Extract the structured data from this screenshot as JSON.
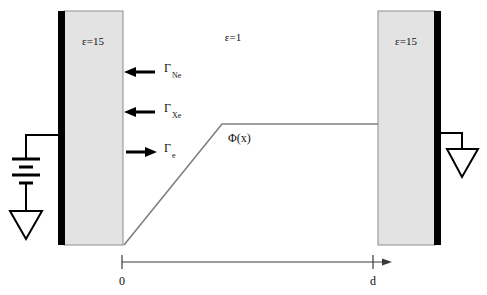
{
  "figure": {
    "kind": "parallel-plate-capacitor-cross-section",
    "background_color": "#ffffff"
  },
  "regions": {
    "left_slab": {
      "permittivity_label": "ε=15",
      "fill_color": "#e3e3e3",
      "border_color": "#8d8d8d",
      "electrode_color": "#000000",
      "electrode_side": "left"
    },
    "gap": {
      "permittivity_label": "ε=1"
    },
    "right_slab": {
      "permittivity_label": "ε=15",
      "fill_color": "#e3e3e3",
      "border_color": "#8d8d8d",
      "electrode_color": "#000000",
      "electrode_side": "right"
    }
  },
  "fluxes": [
    {
      "symbol": "Γ",
      "subscript": "Ne",
      "direction": "left",
      "full_label": "Γ_Ne"
    },
    {
      "symbol": "Γ",
      "subscript": "Xe",
      "direction": "left",
      "full_label": "Γ_Xe"
    },
    {
      "symbol": "Γ",
      "subscript": "e",
      "direction": "right",
      "full_label": "Γ_e"
    }
  ],
  "potential": {
    "label": "Φ(x)",
    "curve_color": "#808080",
    "shape": "rises linearly from x=0 then flat plateau to x=d"
  },
  "circuit": {
    "left": {
      "element": "battery",
      "ground": "ground-symbol"
    },
    "right": {
      "element": "ground-symbol"
    }
  },
  "axis": {
    "origin_label": "0",
    "end_label": "d",
    "arrow": true
  }
}
